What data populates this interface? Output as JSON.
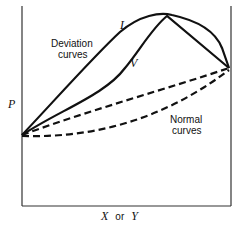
{
  "diagram": {
    "y_axis_label": "P",
    "x_axis_label_var1": "X",
    "x_axis_label_or": "or",
    "x_axis_label_var2": "Y",
    "curve_labels": {
      "L": "L",
      "V": "V"
    },
    "groups": {
      "deviation_line1": "Deviation",
      "deviation_line2": "curves",
      "normal_line1": "Normal",
      "normal_line2": "curves"
    },
    "colors": {
      "line": "#111111",
      "background": "#ffffff"
    }
  }
}
